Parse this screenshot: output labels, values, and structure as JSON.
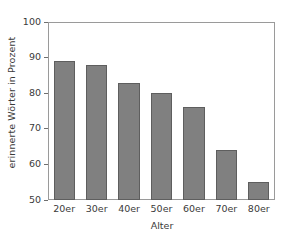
{
  "chart_data": {
    "type": "bar",
    "title": "",
    "subtitle": "",
    "xlabel": "Alter",
    "ylabel": "erinnerte Wörter in Prozent",
    "categories": [
      "20er",
      "30er",
      "40er",
      "50er",
      "60er",
      "70er",
      "80er"
    ],
    "values": [
      89,
      88,
      83,
      80,
      76,
      64,
      55
    ],
    "ylim": [
      50,
      100
    ],
    "yticks": [
      50,
      60,
      70,
      80,
      90,
      100
    ],
    "ytick_labels": [
      "50",
      "60",
      "70",
      "80",
      "90",
      "100"
    ],
    "grid": false,
    "legend": null,
    "legend_position": "none",
    "annotations": [],
    "colors": {
      "bar_fill": "#808080",
      "bar_edge": "#5e5e5e",
      "frame": "#9a9a9a",
      "text": "#3a3a3a",
      "background": "#ffffff"
    }
  }
}
